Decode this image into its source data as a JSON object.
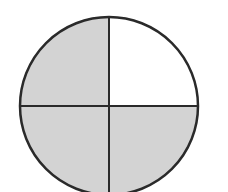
{
  "diagram": {
    "type": "fraction-circle",
    "total_parts": 4,
    "shaded_parts": 3,
    "quadrants": [
      {
        "position": "top-left",
        "shaded": true
      },
      {
        "position": "top-right",
        "shaded": false
      },
      {
        "position": "bottom-left",
        "shaded": true
      },
      {
        "position": "bottom-right",
        "shaded": true
      }
    ],
    "colors": {
      "shaded_fill": "#d3d3d3",
      "unshaded_fill": "#ffffff",
      "stroke": "#2a2a2a",
      "background": "#ffffff"
    },
    "geometry": {
      "cx": 109,
      "cy": 106,
      "r": 89,
      "stroke_width": 2.5,
      "divider_width": 2
    }
  }
}
